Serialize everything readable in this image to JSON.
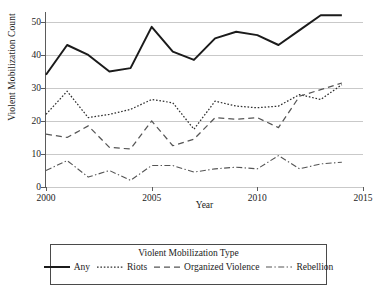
{
  "chart_data": {
    "type": "line",
    "title": "",
    "xlabel": "Year",
    "ylabel": "Violent Mobilization Count",
    "x": [
      2000,
      2001,
      2002,
      2003,
      2004,
      2005,
      2006,
      2007,
      2008,
      2009,
      2010,
      2011,
      2012,
      2013,
      2014
    ],
    "xlim": [
      2000,
      2015
    ],
    "ylim": [
      0,
      53
    ],
    "xticks": [
      2000,
      2005,
      2010,
      2015
    ],
    "yticks": [
      0,
      10,
      20,
      30,
      40,
      50
    ],
    "grid": true,
    "legend_position": "below",
    "legend_title": "Violent Mobilization Type",
    "series": [
      {
        "name": "Any",
        "style": "solid",
        "color": "#1b1b1b",
        "values": [
          34,
          43,
          40,
          35,
          36,
          48.5,
          41,
          38.5,
          45,
          47,
          46,
          43,
          47.5,
          52,
          52
        ]
      },
      {
        "name": "Riots",
        "style": "dotted",
        "color": "#2e2e2e",
        "values": [
          22,
          29,
          21,
          22,
          23.5,
          26.5,
          25.5,
          17.5,
          26,
          24.5,
          24,
          24.5,
          28,
          26.5,
          31
        ]
      },
      {
        "name": "Organized Violence",
        "style": "dashed",
        "color": "#555555",
        "values": [
          16,
          15,
          18.5,
          12,
          11.5,
          20,
          12.5,
          14.5,
          21,
          20.5,
          21,
          18,
          27.5,
          29.5,
          31.5
        ]
      },
      {
        "name": "Rebellion",
        "style": "dashdot",
        "color": "#555555",
        "values": [
          5,
          8,
          3,
          5,
          2,
          6.5,
          6.5,
          4.5,
          5.5,
          6,
          5.5,
          9.5,
          5.5,
          7,
          7.5
        ]
      }
    ]
  }
}
